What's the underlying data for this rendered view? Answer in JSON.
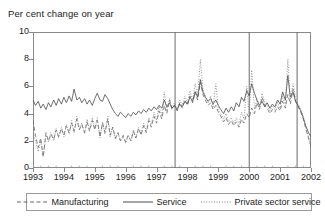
{
  "chart_data": {
    "type": "line",
    "title": "Per cent change on year",
    "xlabel": "",
    "ylabel": "Per cent change on year",
    "ylim": [
      0,
      10
    ],
    "xlim": [
      1993,
      2002
    ],
    "yticks": [
      0,
      2,
      4,
      6,
      8,
      10
    ],
    "xticks": [
      1993,
      1994,
      1995,
      1996,
      1997,
      1998,
      1999,
      2000,
      2001,
      2002
    ],
    "grid": false,
    "legend_position": "bottom",
    "vertical_reference_lines": [
      1997.6,
      2000.0,
      2001.55
    ],
    "series": [
      {
        "name": "Manufacturing",
        "style": "dashed",
        "color": "#666666",
        "x": [
          1993.0,
          1993.08,
          1993.17,
          1993.25,
          1993.33,
          1993.42,
          1993.5,
          1993.58,
          1993.67,
          1993.75,
          1993.83,
          1993.92,
          1994.0,
          1994.08,
          1994.17,
          1994.25,
          1994.33,
          1994.42,
          1994.5,
          1994.58,
          1994.67,
          1994.75,
          1994.83,
          1994.92,
          1995.0,
          1995.08,
          1995.17,
          1995.25,
          1995.33,
          1995.42,
          1995.5,
          1995.58,
          1995.67,
          1995.75,
          1995.83,
          1995.92,
          1996.0,
          1996.08,
          1996.17,
          1996.25,
          1996.33,
          1996.42,
          1996.5,
          1996.58,
          1996.67,
          1996.75,
          1996.83,
          1996.92,
          1997.0,
          1997.08,
          1997.17,
          1997.25,
          1997.33,
          1997.42,
          1997.5,
          1997.58,
          1997.67,
          1997.75,
          1997.83,
          1997.92,
          1998.0,
          1998.08,
          1998.17,
          1998.25,
          1998.33,
          1998.42,
          1998.5,
          1998.58,
          1998.67,
          1998.75,
          1998.83,
          1998.92,
          1999.0,
          1999.08,
          1999.17,
          1999.25,
          1999.33,
          1999.42,
          1999.5,
          1999.58,
          1999.67,
          1999.75,
          1999.83,
          1999.92,
          2000.0,
          2000.08,
          2000.17,
          2000.25,
          2000.33,
          2000.42,
          2000.5,
          2000.58,
          2000.67,
          2000.75,
          2000.83,
          2000.92,
          2001.0,
          2001.08,
          2001.17,
          2001.25,
          2001.33,
          2001.42,
          2001.5,
          2001.58,
          2001.67,
          2001.75,
          2001.83,
          2001.92,
          2002.0
        ],
        "y": [
          3.5,
          2.4,
          1.5,
          2.2,
          0.8,
          2.6,
          2.0,
          2.5,
          2.1,
          2.8,
          2.3,
          2.9,
          2.4,
          3.1,
          2.6,
          3.3,
          2.7,
          3.6,
          2.8,
          3.2,
          2.6,
          3.4,
          2.7,
          3.5,
          2.8,
          3.5,
          2.3,
          3.3,
          2.6,
          3.6,
          2.4,
          3.0,
          2.2,
          2.6,
          2.0,
          2.4,
          1.9,
          2.4,
          2.0,
          2.7,
          2.2,
          2.9,
          2.4,
          3.1,
          2.6,
          3.5,
          3.0,
          3.8,
          3.3,
          4.2,
          3.6,
          4.6,
          4.0,
          5.0,
          4.3,
          4.6,
          4.2,
          4.8,
          4.4,
          5.0,
          4.6,
          5.3,
          4.8,
          5.6,
          5.0,
          6.3,
          5.4,
          5.0,
          4.6,
          4.8,
          4.3,
          4.6,
          4.1,
          3.8,
          3.4,
          3.7,
          3.2,
          3.5,
          3.1,
          3.4,
          3.0,
          3.6,
          3.3,
          4.0,
          3.7,
          4.4,
          4.0,
          4.8,
          4.3,
          5.2,
          4.6,
          4.4,
          4.0,
          4.3,
          4.1,
          4.5,
          4.2,
          4.9,
          4.4,
          5.4,
          4.7,
          5.8,
          4.9,
          4.5,
          4.1,
          3.6,
          2.9,
          2.2,
          1.6
        ]
      },
      {
        "name": "Service",
        "style": "solid",
        "color": "#4a4a4a",
        "x": [
          1993.0,
          1993.08,
          1993.17,
          1993.25,
          1993.33,
          1993.42,
          1993.5,
          1993.58,
          1993.67,
          1993.75,
          1993.83,
          1993.92,
          1994.0,
          1994.08,
          1994.17,
          1994.25,
          1994.33,
          1994.42,
          1994.5,
          1994.58,
          1994.67,
          1994.75,
          1994.83,
          1994.92,
          1995.0,
          1995.08,
          1995.17,
          1995.25,
          1995.33,
          1995.42,
          1995.5,
          1995.58,
          1995.67,
          1995.75,
          1995.83,
          1995.92,
          1996.0,
          1996.08,
          1996.17,
          1996.25,
          1996.33,
          1996.42,
          1996.5,
          1996.58,
          1996.67,
          1996.75,
          1996.83,
          1996.92,
          1997.0,
          1997.08,
          1997.17,
          1997.25,
          1997.33,
          1997.42,
          1997.5,
          1997.58,
          1997.67,
          1997.75,
          1997.83,
          1997.92,
          1998.0,
          1998.08,
          1998.17,
          1998.25,
          1998.33,
          1998.42,
          1998.5,
          1998.58,
          1998.67,
          1998.75,
          1998.83,
          1998.92,
          1999.0,
          1999.08,
          1999.17,
          1999.25,
          1999.33,
          1999.42,
          1999.5,
          1999.58,
          1999.67,
          1999.75,
          1999.83,
          1999.92,
          2000.0,
          2000.08,
          2000.17,
          2000.25,
          2000.33,
          2000.42,
          2000.5,
          2000.58,
          2000.67,
          2000.75,
          2000.83,
          2000.92,
          2001.0,
          2001.08,
          2001.17,
          2001.25,
          2001.33,
          2001.42,
          2001.5,
          2001.58,
          2001.67,
          2001.75,
          2001.83,
          2001.92,
          2002.0
        ],
        "y": [
          5.0,
          4.6,
          4.9,
          4.4,
          4.7,
          4.3,
          4.8,
          4.5,
          5.0,
          4.6,
          5.1,
          4.7,
          5.2,
          4.8,
          5.3,
          4.9,
          5.8,
          5.0,
          5.2,
          4.8,
          5.1,
          4.7,
          5.0,
          4.6,
          5.1,
          5.5,
          5.0,
          4.9,
          5.4,
          5.1,
          4.7,
          4.3,
          4.0,
          3.8,
          4.1,
          3.9,
          3.7,
          4.0,
          3.8,
          4.1,
          3.9,
          4.2,
          4.0,
          4.3,
          4.1,
          4.4,
          4.2,
          4.5,
          4.3,
          4.6,
          4.4,
          5.0,
          4.5,
          4.8,
          4.4,
          4.6,
          4.3,
          4.7,
          4.5,
          4.9,
          4.7,
          5.2,
          4.9,
          5.6,
          5.2,
          6.5,
          5.6,
          5.2,
          4.9,
          5.1,
          4.7,
          5.0,
          4.6,
          4.3,
          4.0,
          4.4,
          4.1,
          4.5,
          4.2,
          4.8,
          4.5,
          5.2,
          4.9,
          5.7,
          5.3,
          6.2,
          5.5,
          5.0,
          4.6,
          4.9,
          4.5,
          4.8,
          4.4,
          4.7,
          4.5,
          5.0,
          4.7,
          5.6,
          5.0,
          6.8,
          5.2,
          5.6,
          4.9,
          4.6,
          4.2,
          3.7,
          3.1,
          2.6,
          2.3
        ]
      },
      {
        "name": "Private sector service",
        "style": "dotted",
        "color": "#7a7a7a",
        "x": [
          1993.0,
          1993.08,
          1993.17,
          1993.25,
          1993.33,
          1993.42,
          1993.5,
          1993.58,
          1993.67,
          1993.75,
          1993.83,
          1993.92,
          1994.0,
          1994.08,
          1994.17,
          1994.25,
          1994.33,
          1994.42,
          1994.5,
          1994.58,
          1994.67,
          1994.75,
          1994.83,
          1994.92,
          1995.0,
          1995.08,
          1995.17,
          1995.25,
          1995.33,
          1995.42,
          1995.5,
          1995.58,
          1995.67,
          1995.75,
          1995.83,
          1995.92,
          1996.0,
          1996.08,
          1996.17,
          1996.25,
          1996.33,
          1996.42,
          1996.5,
          1996.58,
          1996.67,
          1996.75,
          1996.83,
          1996.92,
          1997.0,
          1997.08,
          1997.17,
          1997.25,
          1997.33,
          1997.42,
          1997.5,
          1997.58,
          1997.67,
          1997.75,
          1997.83,
          1997.92,
          1998.0,
          1998.08,
          1998.17,
          1998.25,
          1998.33,
          1998.42,
          1998.5,
          1998.58,
          1998.67,
          1998.75,
          1998.83,
          1998.92,
          1999.0,
          1999.08,
          1999.17,
          1999.25,
          1999.33,
          1999.42,
          1999.5,
          1999.58,
          1999.67,
          1999.75,
          1999.83,
          1999.92,
          2000.0,
          2000.08,
          2000.17,
          2000.25,
          2000.33,
          2000.42,
          2000.5,
          2000.58,
          2000.67,
          2000.75,
          2000.83,
          2000.92,
          2001.0,
          2001.08,
          2001.17,
          2001.25,
          2001.33,
          2001.42,
          2001.5,
          2001.58,
          2001.67,
          2001.75,
          2001.83,
          2001.92,
          2002.0
        ],
        "y": [
          2.6,
          2.0,
          1.2,
          2.0,
          0.9,
          2.4,
          1.9,
          2.6,
          2.0,
          2.9,
          2.2,
          3.0,
          2.3,
          3.2,
          2.5,
          3.5,
          2.6,
          3.8,
          2.9,
          3.3,
          2.5,
          3.6,
          2.8,
          3.7,
          2.9,
          3.7,
          2.2,
          3.4,
          2.5,
          3.8,
          2.3,
          3.0,
          2.1,
          2.6,
          2.0,
          2.3,
          1.8,
          2.4,
          2.0,
          2.8,
          2.2,
          3.0,
          2.5,
          3.3,
          2.7,
          3.7,
          3.2,
          4.1,
          3.5,
          4.6,
          3.8,
          5.6,
          4.2,
          5.1,
          4.4,
          4.8,
          4.3,
          5.0,
          4.6,
          5.3,
          4.8,
          5.7,
          5.0,
          6.2,
          5.3,
          8.0,
          5.8,
          5.3,
          4.8,
          5.3,
          4.5,
          6.2,
          4.3,
          4.0,
          3.6,
          4.0,
          3.4,
          3.7,
          3.3,
          3.7,
          3.2,
          4.1,
          3.6,
          6.0,
          4.0,
          7.2,
          4.3,
          5.1,
          4.5,
          5.5,
          4.8,
          4.6,
          4.2,
          4.6,
          4.3,
          4.8,
          4.4,
          5.3,
          4.6,
          8.0,
          5.0,
          6.2,
          5.1,
          4.7,
          4.3,
          3.8,
          3.0,
          2.3,
          1.5
        ]
      }
    ]
  },
  "legend": {
    "items": [
      {
        "label": "Manufacturing",
        "style": "dashed"
      },
      {
        "label": "Service",
        "style": "solid"
      },
      {
        "label": "Private sector service",
        "style": "dotted"
      }
    ]
  },
  "axes": {
    "ytick_labels": [
      "10",
      "8",
      "6",
      "4",
      "2",
      "0"
    ],
    "xtick_labels": [
      "1993",
      "1994",
      "1995",
      "1996",
      "1997",
      "1998",
      "1999",
      "2000",
      "2001",
      "2002"
    ]
  },
  "colors": {
    "axis": "#8a8a8a",
    "text": "#1a1a1a",
    "manufacturing": "#666666",
    "service": "#4a4a4a",
    "private_sector_service": "#7a7a7a"
  }
}
